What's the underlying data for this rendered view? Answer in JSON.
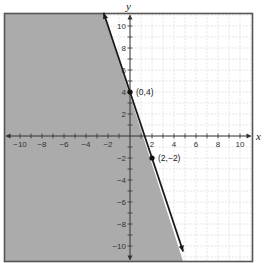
{
  "chart_data": {
    "type": "line",
    "title": "",
    "xlabel": "x",
    "ylabel": "y",
    "xlim": [
      -11,
      11
    ],
    "ylim": [
      -11,
      11
    ],
    "grid": true,
    "x_ticks": [
      -10,
      -8,
      -6,
      -4,
      -2,
      2,
      4,
      6,
      8,
      10
    ],
    "y_ticks": [
      10,
      8,
      6,
      4,
      2,
      -2,
      -4,
      -6,
      -8,
      -10
    ],
    "series": [
      {
        "name": "boundary line",
        "equation": "y = -3x + 4",
        "style": "solid",
        "x": [
          -2.4,
          4.83
        ],
        "y": [
          11.2,
          -10.5
        ]
      }
    ],
    "shaded_region": "left of line (y < -3x + 4)",
    "points": [
      {
        "x": 0,
        "y": 4,
        "label": "(0,4)"
      },
      {
        "x": 2,
        "y": -2,
        "label": "(2,−2)"
      }
    ],
    "colors": {
      "shade": "#a6a6a6",
      "line": "#1a1a1a",
      "grid": "#d4d4d4",
      "border": "#555555"
    }
  },
  "labels": {
    "x_axis": "x",
    "y_axis": "y",
    "point_a": "(0,4)",
    "point_b": "(2,−2)"
  }
}
